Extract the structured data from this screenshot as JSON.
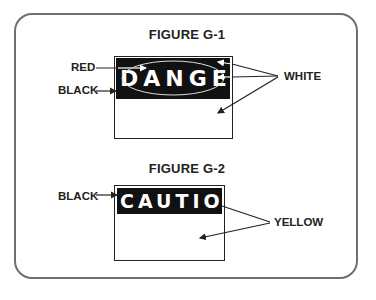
{
  "figures": [
    {
      "title": "FIGURE G-1",
      "sign_word": "DANGER",
      "labels": {
        "red": "RED",
        "black": "BLACK",
        "white": "WHITE"
      }
    },
    {
      "title": "FIGURE G-2",
      "sign_word": "CAUTION",
      "labels": {
        "black": "BLACK",
        "yellow": "YELLOW"
      }
    }
  ],
  "colors": {
    "frame": "#6f6f6f",
    "ink": "#222222",
    "header_bg": "#111111",
    "text_white": "#ffffff"
  }
}
